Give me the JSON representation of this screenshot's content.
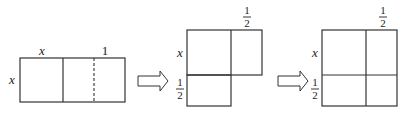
{
  "figures": [
    {
      "name": "rectangle-x-by-x-plus-1",
      "top_labels": [
        "x",
        "1"
      ],
      "side_label": "x"
    },
    {
      "name": "square-split-half",
      "top_label": {
        "num": "1",
        "den": "2"
      },
      "side_labels": [
        "x",
        {
          "num": "1",
          "den": "2"
        }
      ]
    },
    {
      "name": "completed-square",
      "top_label": {
        "num": "1",
        "den": "2"
      },
      "side_labels": [
        "x",
        {
          "num": "1",
          "den": "2"
        }
      ]
    }
  ],
  "labels": {
    "x": "x",
    "one": "1",
    "half_num": "1",
    "half_den": "2"
  },
  "arrows": [
    "right-arrow",
    "right-arrow"
  ]
}
